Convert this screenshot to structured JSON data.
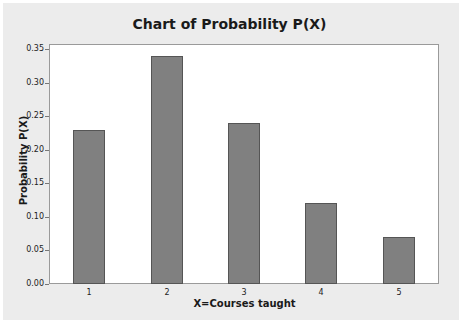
{
  "chart_data": {
    "type": "bar",
    "title": "Chart of Probability P(X)",
    "xlabel": "X=Courses taught",
    "ylabel": "Probability P(X)",
    "categories": [
      "1",
      "2",
      "3",
      "4",
      "5"
    ],
    "values": [
      0.23,
      0.34,
      0.24,
      0.12,
      0.07
    ],
    "ylim": [
      0,
      0.35
    ],
    "yticks": [
      "0.00",
      "0.05",
      "0.10",
      "0.15",
      "0.20",
      "0.25",
      "0.30",
      "0.35"
    ],
    "grid": false,
    "legend": null,
    "bar_color": "#808080"
  }
}
